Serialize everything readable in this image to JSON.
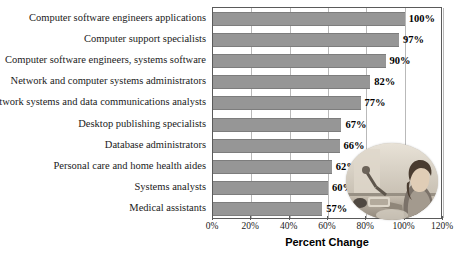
{
  "chart_data": {
    "type": "bar",
    "orientation": "horizontal",
    "title": "",
    "xlabel": "Percent Change",
    "ylabel": "",
    "xlim": [
      0,
      120
    ],
    "xticks": [
      "0%",
      "20%",
      "40%",
      "60%",
      "80%",
      "100%",
      "120%"
    ],
    "xtick_values": [
      0,
      20,
      40,
      60,
      80,
      100,
      120
    ],
    "grid": true,
    "legend": false,
    "categories": [
      "Computer software engineers applications",
      "Computer support specialists",
      "Computer software engineers, systems software",
      "Network and computer systems administrators",
      "Network systems and data communications analysts",
      "Desktop publishing specialists",
      "Database administrators",
      "Personal care and home health aides",
      "Systems analysts",
      "Medical assistants"
    ],
    "values": [
      100,
      97,
      90,
      82,
      77,
      67,
      66,
      62,
      60,
      57
    ],
    "value_labels": [
      "100%",
      "97%",
      "90%",
      "82%",
      "77%",
      "67%",
      "66%",
      "62%",
      "60%",
      "57%"
    ],
    "bar_color": "#969696",
    "bar_edge_color": "#7d7d7d",
    "grid_color": "#b9b9b9",
    "axis_color": "#5a5a5a",
    "background_color": "#ffffff"
  },
  "overlay": {
    "photo_alt": "person seated at a desk"
  }
}
